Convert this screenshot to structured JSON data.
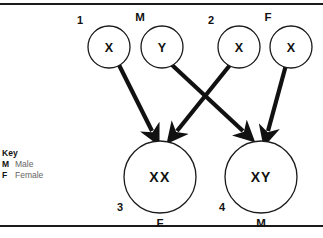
{
  "diagram": {
    "frame": {
      "top_rule": true,
      "bottom_rule": true,
      "rule_color": "#1a1a1a"
    },
    "parent_nodes": [
      {
        "id": "p1",
        "allele": "X",
        "number": "1",
        "sex_label": "",
        "cx": 109,
        "cy": 47,
        "r": 21
      },
      {
        "id": "p2",
        "allele": "Y",
        "number": "",
        "sex_label": "M",
        "cx": 162,
        "cy": 47,
        "r": 21
      },
      {
        "id": "p3",
        "allele": "X",
        "number": "2",
        "sex_label": "",
        "cx": 239,
        "cy": 47,
        "r": 21
      },
      {
        "id": "p4",
        "allele": "X",
        "number": "",
        "sex_label": "F",
        "cx": 291,
        "cy": 47,
        "r": 21
      }
    ],
    "offspring_nodes": [
      {
        "id": "o1",
        "genotype": "XX",
        "number": "3",
        "sex_label": "F",
        "cx": 160,
        "cy": 177,
        "r": 36
      },
      {
        "id": "o2",
        "genotype": "XY",
        "number": "4",
        "sex_label": "M",
        "cx": 261,
        "cy": 177,
        "r": 36
      }
    ],
    "arrows": [
      {
        "from": "p1",
        "to": "o1",
        "x1": 119,
        "y1": 65,
        "x2": 152,
        "y2": 132
      },
      {
        "from": "p2",
        "to": "o2",
        "x1": 172,
        "y1": 65,
        "x2": 243,
        "y2": 132
      },
      {
        "from": "p3",
        "to": "o1",
        "x1": 230,
        "y1": 65,
        "x2": 176,
        "y2": 132
      },
      {
        "from": "p4",
        "to": "o2",
        "x1": 285,
        "y1": 65,
        "x2": 268,
        "y2": 132
      }
    ],
    "labels": {
      "male_symbol": "M",
      "female_symbol": "F",
      "allele_x": "X",
      "allele_y": "Y",
      "genotype_xx": "XX",
      "genotype_xy": "XY",
      "n1": "1",
      "n2": "2",
      "n3": "3",
      "n4": "4"
    },
    "key": {
      "title": "Key",
      "entries": [
        {
          "symbol": "M",
          "meaning": "Male"
        },
        {
          "symbol": "F",
          "meaning": "Female"
        }
      ]
    },
    "colors": {
      "ink": "#111111",
      "rule": "#1a1a1a",
      "key_text": "#666666",
      "background": "#ffffff"
    }
  }
}
